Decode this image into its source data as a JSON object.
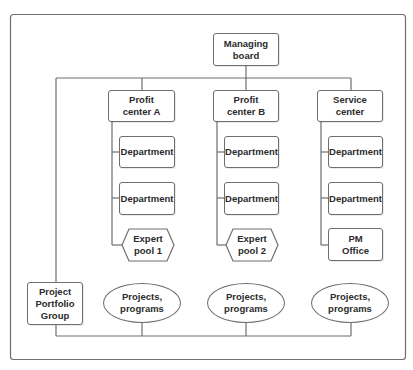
{
  "diagram": {
    "type": "org-chart",
    "colors": {
      "line": "#6e6e6e",
      "fill": "#ffffff",
      "text": "#2b2b2b"
    },
    "nodes": {
      "managing_board": "Managing\nboard",
      "profit_center_a": "Profit\ncenter A",
      "profit_center_b": "Profit\ncenter B",
      "service_center": "Service\ncenter",
      "dept_a1": "Department",
      "dept_a2": "Department",
      "dept_b1": "Department",
      "dept_b2": "Department",
      "dept_c1": "Department",
      "dept_c2": "Department",
      "expert_pool_1": "Expert\npool 1",
      "expert_pool_2": "Expert\npool 2",
      "pm_office": "PM\nOffice",
      "project_portfolio_group": "Project\nPortfolio\nGroup",
      "projects_1": "Projects,\nprograms",
      "projects_2": "Projects,\nprograms",
      "projects_3": "Projects,\nprograms"
    },
    "edges": [
      [
        "managing_board",
        "profit_center_a"
      ],
      [
        "managing_board",
        "profit_center_b"
      ],
      [
        "managing_board",
        "service_center"
      ],
      [
        "managing_board",
        "project_portfolio_group"
      ],
      [
        "profit_center_a",
        "dept_a1"
      ],
      [
        "profit_center_a",
        "dept_a2"
      ],
      [
        "profit_center_a",
        "expert_pool_1"
      ],
      [
        "profit_center_b",
        "dept_b1"
      ],
      [
        "profit_center_b",
        "dept_b2"
      ],
      [
        "profit_center_b",
        "expert_pool_2"
      ],
      [
        "service_center",
        "dept_c1"
      ],
      [
        "service_center",
        "dept_c2"
      ],
      [
        "service_center",
        "pm_office"
      ],
      [
        "project_portfolio_group",
        "projects_1"
      ],
      [
        "project_portfolio_group",
        "projects_2"
      ],
      [
        "project_portfolio_group",
        "projects_3"
      ]
    ]
  }
}
